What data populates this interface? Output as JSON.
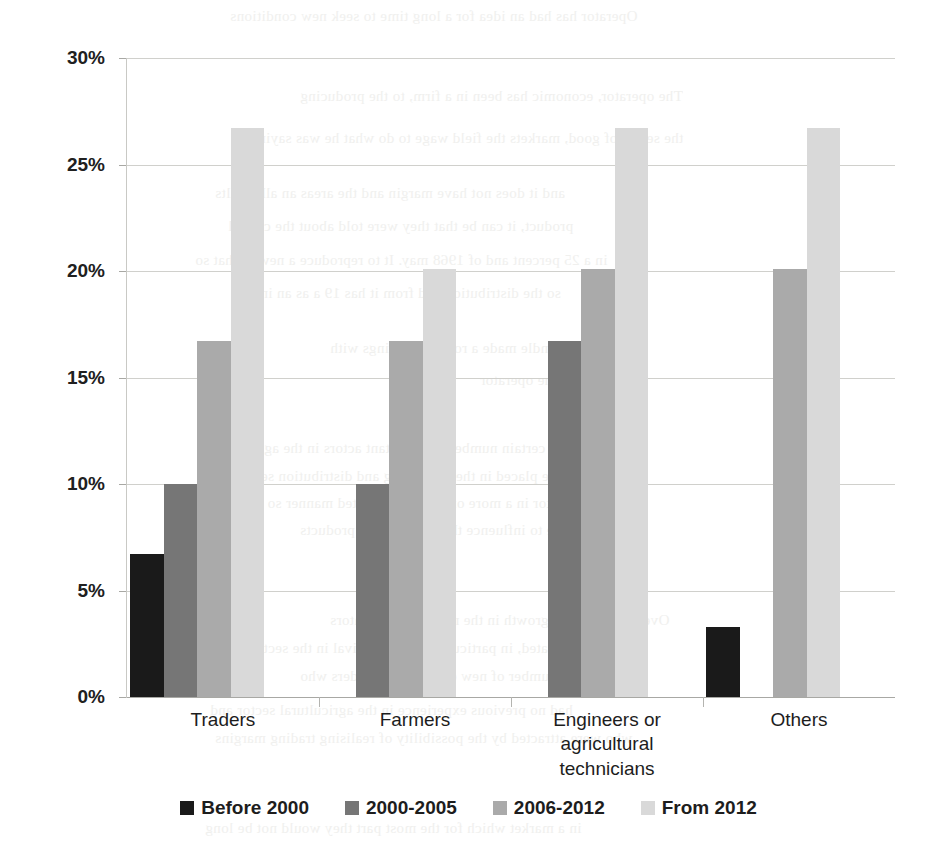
{
  "chart_data": {
    "type": "bar",
    "title": "",
    "subtitle": "",
    "xlabel": "",
    "ylabel": "",
    "ylim": [
      0,
      30
    ],
    "y_tick_labels": [
      "0%",
      "5%",
      "10%",
      "15%",
      "20%",
      "25%",
      "30%"
    ],
    "y_tick_values": [
      0,
      5,
      10,
      15,
      20,
      25,
      30
    ],
    "grid": true,
    "legend_position": "bottom",
    "value_unit": "%",
    "categories": [
      "Traders",
      "Farmers",
      "Engineers or agricultural technicians",
      "Others"
    ],
    "category_lines": [
      [
        "Traders"
      ],
      [
        "Farmers"
      ],
      [
        "Engineers or agricultural",
        "technicians"
      ],
      [
        "Others"
      ]
    ],
    "series": [
      {
        "name": "Before 2000",
        "color": "#1a1a1a",
        "values": [
          6.7,
          0,
          0,
          3.3
        ]
      },
      {
        "name": "2000-2005",
        "color": "#767676",
        "values": [
          10.0,
          10.0,
          16.7,
          0
        ]
      },
      {
        "name": "2006-2012",
        "color": "#aaaaaa",
        "values": [
          16.7,
          16.7,
          20.1,
          20.1
        ]
      },
      {
        "name": "From 2012",
        "color": "#d9d9d9",
        "values": [
          26.7,
          20.1,
          26.7,
          26.7
        ]
      }
    ]
  },
  "legend": {
    "items": [
      {
        "label": "Before 2000",
        "color": "#1a1a1a"
      },
      {
        "label": "2000-2005",
        "color": "#767676"
      },
      {
        "label": "2006-2012",
        "color": "#aaaaaa"
      },
      {
        "label": "From 2012",
        "color": "#d9d9d9"
      }
    ]
  },
  "background_ghost_text": [
    "Operator has had an idea for a long time to seek new conditions",
    "The operator, economic has been in a firm, to the producing",
    "the sector of good, markets the field wage to do what he was saying",
    "and it does not have margin and the areas an all results",
    "product, it can be that they were told about the capital",
    "in a 25 percent and of 1968 may. It to reproduce a new to that so",
    "so the distribution and from it has 19 a as an in",
    "Other handle made a rotational things with",
    "and to each the operator",
    "Markets of a certain number of important actors in the agricultural",
    "and are placed in the processing and distribution segments",
    "the sector in a more or less concentrated manner so as",
    "to be able to influence the prices of the products",
    "Over the years the growth in the number of operators",
    "has accelerated, in particular with the arrival in the sector",
    "of a large number of new entrants and traders who",
    "had no previous experience in the agricultural sector and",
    "who were attracted by the possibility of realising trading margins",
    "in a market which for the most part they would not be long"
  ]
}
